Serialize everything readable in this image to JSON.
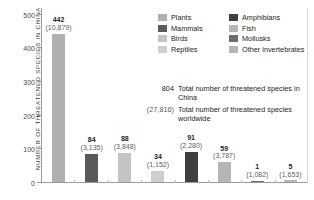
{
  "chart_data": {
    "type": "bar",
    "title": "",
    "xlabel": "",
    "ylabel": "NUMBER OF THREATENED SPECIES IN CHINA",
    "ylim": [
      0,
      520
    ],
    "yticks": [
      0,
      100,
      200,
      300,
      400,
      500
    ],
    "ytick_labels": [
      "0",
      "100",
      "200",
      "300",
      "400",
      "500"
    ],
    "grid": false,
    "legend_position": "upper-right",
    "categories": [
      "Plants",
      "Mammals",
      "Birds",
      "Reptiles",
      "Amphibians",
      "Fish",
      "Mollusks",
      "Other invertebrates"
    ],
    "values": [
      442,
      84,
      88,
      34,
      91,
      59,
      1,
      5
    ],
    "series": [
      {
        "name": "Threatened species in China",
        "values": [
          442,
          84,
          88,
          34,
          91,
          59,
          1,
          5
        ]
      },
      {
        "name": "Threatened species worldwide",
        "values": [
          10879,
          3135,
          3848,
          1152,
          2280,
          3787,
          1082,
          1653
        ]
      }
    ],
    "bars": [
      {
        "category": "Plants",
        "china": 442,
        "china_label": "442",
        "world_label": "(10,879)",
        "color": "#b0b0b0"
      },
      {
        "category": "Mammals",
        "china": 84,
        "china_label": "84",
        "world_label": "(3,135)",
        "color": "#5a5a5a"
      },
      {
        "category": "Birds",
        "china": 88,
        "china_label": "88",
        "world_label": "(3,848)",
        "color": "#c4c4c4"
      },
      {
        "category": "Reptiles",
        "china": 34,
        "china_label": "34",
        "world_label": "(1,152)",
        "color": "#cfcfcf"
      },
      {
        "category": "Amphibians",
        "china": 91,
        "china_label": "91",
        "world_label": "(2,280)",
        "color": "#3f3f3f"
      },
      {
        "category": "Fish",
        "china": 59,
        "china_label": "59",
        "world_label": "(3,787)",
        "color": "#b6b6b6"
      },
      {
        "category": "Mollusks",
        "china": 1,
        "china_label": "1",
        "world_label": "(1,082)",
        "color": "#6e6e6e"
      },
      {
        "category": "Other invertebrates",
        "china": 5,
        "china_label": "5",
        "world_label": "(1,653)",
        "color": "#b6b6b6"
      }
    ],
    "annotations": [
      {
        "value": "804",
        "text": "Total number of threatened species in China"
      },
      {
        "value": "(27,816)",
        "text": "Total number of threatened species worldwide"
      }
    ]
  },
  "legend": {
    "column_a": [
      {
        "label": "Plants",
        "color": "#b0b0b0"
      },
      {
        "label": "Mammals",
        "color": "#5a5a5a"
      },
      {
        "label": "Birds",
        "color": "#c4c4c4"
      },
      {
        "label": "Reptiles",
        "color": "#cfcfcf"
      }
    ],
    "column_b": [
      {
        "label": "Amphibians",
        "color": "#3f3f3f"
      },
      {
        "label": "Fish",
        "color": "#b6b6b6"
      },
      {
        "label": "Mollusks",
        "color": "#6e6e6e"
      },
      {
        "label": "Other invertebrates",
        "color": "#b6b6b6"
      }
    ]
  },
  "totals": {
    "china_value": "804",
    "china_text": "Total number of threatened species in China",
    "world_value": "(27,816)",
    "world_text": "Total number of threatened species worldwide"
  },
  "colors": {
    "axis": "#9a9a9a",
    "text": "#231f20",
    "muted_text": "#5e5e5e",
    "background": "#ffffff"
  }
}
